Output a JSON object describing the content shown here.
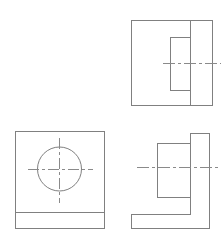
{
  "sheet": {
    "title": "Orthographic Projection Drawing",
    "description": "Three-view technical drawing of an L-shaped bracket with a through hole",
    "width": 224,
    "height": 244,
    "background_color": "#ffffff",
    "line_color": "#808080",
    "centerline_color": "#8a8a8a",
    "projection": "third-angle"
  },
  "views": [
    {
      "id": "side-view",
      "name": "Side View",
      "position": "top-right",
      "outline": {
        "x": 131,
        "y": 20,
        "width": 81,
        "height": 85
      },
      "vertical_division_x": 190,
      "inner_rectangle": {
        "x": 170,
        "y": 37,
        "width": 20,
        "height": 53
      },
      "centerline": {
        "y": 63,
        "x_start": 162,
        "x_end": 220
      }
    },
    {
      "id": "top-view",
      "name": "Top View",
      "position": "bottom-left",
      "outline": {
        "x": 15,
        "y": 131,
        "width": 89,
        "height": 97
      },
      "horizontal_division_y": 212,
      "hole": {
        "center_x": 59,
        "center_y": 169,
        "radius": 22,
        "diameter": 44
      },
      "centerlines": {
        "horizontal": {
          "y": 169,
          "x_start": 27,
          "x_end": 92
        },
        "vertical": {
          "x": 59,
          "y_start": 137,
          "y_end": 202
        }
      }
    },
    {
      "id": "front-view",
      "name": "Front View",
      "position": "bottom-right",
      "profile_points": "131,228 131,214 190,214 190,133 209,133 209,228",
      "outline_bounds": {
        "x": 131,
        "y": 133,
        "width": 78,
        "height": 95
      },
      "step_top_y": 133,
      "step_shelf_y": 214,
      "notch": {
        "x": 157,
        "y": 143,
        "width": 33,
        "height": 54
      },
      "centerline": {
        "y": 167,
        "x_start": 136,
        "x_end": 218
      }
    }
  ]
}
